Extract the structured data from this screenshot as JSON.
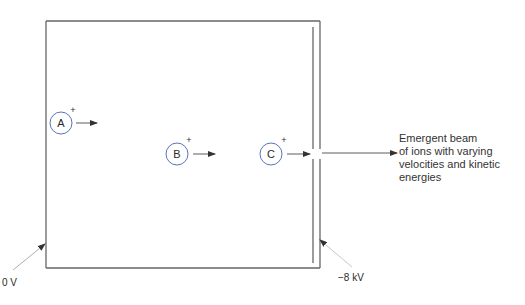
{
  "diagram": {
    "ions": [
      {
        "label": "A",
        "charge": "+"
      },
      {
        "label": "B",
        "charge": "+"
      },
      {
        "label": "C",
        "charge": "+"
      }
    ],
    "beam_label_lines": [
      "Emergent beam",
      "of ions with varying",
      "velocities and kinetic",
      "energies"
    ],
    "left_electrode_label": "0 V",
    "right_electrode_label": "−8 kV",
    "colors": {
      "ion_circle": "#5b74b8",
      "box_line": "#555555",
      "arrow": "#333333"
    }
  }
}
